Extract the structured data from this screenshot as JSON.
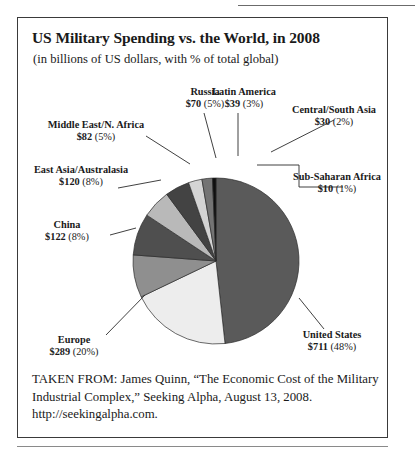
{
  "figure": {
    "title": "US Military Spending vs. the World, in 2008",
    "subtitle": "(in billions of US dollars, with % of total global)"
  },
  "caption": {
    "line1": "TAKEN FROM: James Quinn, “The Economic Cost of the Military",
    "line2": "Industrial Complex,” Seeking Alpha, August 13, 2008.",
    "line3": "http://seekingalpha.com."
  },
  "chart_data": {
    "type": "pie",
    "title": "US Military Spending vs. the World, in 2008",
    "subtitle": "(in billions of US dollars, with % of total global)",
    "unit": "billions of US dollars",
    "value_prefix": "$",
    "total": 1473,
    "start_angle_deg": -90,
    "direction": "clockwise",
    "legend": "none",
    "grid": false,
    "categories": [
      "United States",
      "Europe",
      "China",
      "East Asia/Australasia",
      "Middle East/N. Africa",
      "Russia",
      "Latin America",
      "Central/South Asia",
      "Sub-Saharan Africa"
    ],
    "values": [
      711,
      289,
      122,
      120,
      82,
      70,
      39,
      30,
      10
    ],
    "percents": [
      48,
      20,
      8,
      8,
      5,
      5,
      3,
      2,
      1
    ],
    "slices": [
      {
        "name": "United States",
        "value": 711,
        "value_label": "$711",
        "percent": 48,
        "percent_label": "(48%)",
        "color": "#5a5a5a"
      },
      {
        "name": "Europe",
        "value": 289,
        "value_label": "$289",
        "percent": 20,
        "percent_label": "(20%)",
        "color": "#ededed"
      },
      {
        "name": "China",
        "value": 122,
        "value_label": "$122",
        "percent": 8,
        "percent_label": "(8%)",
        "color": "#8f8f8f"
      },
      {
        "name": "East Asia/Australasia",
        "value": 120,
        "value_label": "$120",
        "percent": 8,
        "percent_label": "(8%)",
        "color": "#4f4f4f"
      },
      {
        "name": "Middle East/N. Africa",
        "value": 82,
        "value_label": "$82",
        "percent": 5,
        "percent_label": "(5%)",
        "color": "#b9b9b9"
      },
      {
        "name": "Russia",
        "value": 70,
        "value_label": "$70",
        "percent": 5,
        "percent_label": "(5%)",
        "color": "#434343"
      },
      {
        "name": "Latin America",
        "value": 39,
        "value_label": "$39",
        "percent": 3,
        "percent_label": "(3%)",
        "color": "#d4d4d4"
      },
      {
        "name": "Central/South Asia",
        "value": 30,
        "value_label": "$30",
        "percent": 2,
        "percent_label": "(2%)",
        "color": "#747474"
      },
      {
        "name": "Sub-Saharan Africa",
        "value": 10,
        "value_label": "$10",
        "percent": 1,
        "percent_label": "(1%)",
        "color": "#0f0f0f"
      }
    ]
  },
  "labels": [
    {
      "key": "russia",
      "name": "Russia",
      "value_label": "$70",
      "percent_label": "(5%)"
    },
    {
      "key": "latin-america",
      "name": "Latin America",
      "value_label": "$39",
      "percent_label": "(3%)"
    },
    {
      "key": "central-south-asia",
      "name": "Central/South Asia",
      "value_label": "$30",
      "percent_label": "(2%)"
    },
    {
      "key": "middle-east",
      "name": "Middle East/N. Africa",
      "value_label": "$82",
      "percent_label": "(5%)"
    },
    {
      "key": "east-asia",
      "name": "East Asia/Australasia",
      "value_label": "$120",
      "percent_label": "(8%)"
    },
    {
      "key": "sub-saharan-africa",
      "name": "Sub-Saharan Africa",
      "value_label": "$10",
      "percent_label": "(1%)"
    },
    {
      "key": "china",
      "name": "China",
      "value_label": "$122",
      "percent_label": "(8%)"
    },
    {
      "key": "europe",
      "name": "Europe",
      "value_label": "$289",
      "percent_label": "(20%)"
    },
    {
      "key": "united-states",
      "name": "United States",
      "value_label": "$711",
      "percent_label": "(48%)"
    }
  ]
}
